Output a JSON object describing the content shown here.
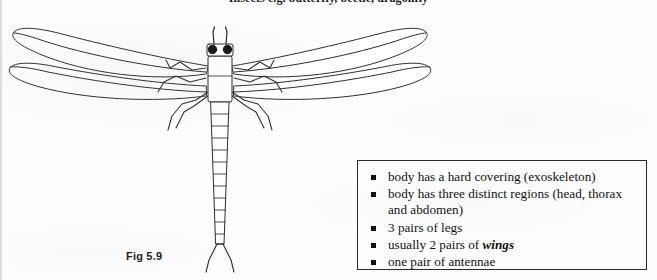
{
  "page": {
    "heading": "Insects e.g. butterfly, beetle, dragonfly",
    "figure_caption": "Fig 5.9"
  },
  "figure": {
    "subject": "dragonfly",
    "alt": "line drawing of a dragonfly seen from above",
    "parts": [
      "antennae",
      "compound eyes",
      "head",
      "thorax",
      "forewings",
      "hindwings",
      "legs",
      "segmented abdomen",
      "tail cerci"
    ],
    "abdomen_segments": 11,
    "wing_pairs": 2,
    "leg_pairs": 3,
    "antennae_pairs": 1,
    "line_color": "#2a2a2a",
    "fill_color": "#ffffff"
  },
  "facts_box": {
    "border_color": "#2b2b2b",
    "bullet_glyph": "square",
    "items": [
      {
        "text": "body has a hard covering (exoskeleton)"
      },
      {
        "text": "body has three distinct regions (head, thorax and abdomen)"
      },
      {
        "text": "3 pairs of legs"
      },
      {
        "text_before": "usually 2 pairs of ",
        "emphasis": "wings",
        "text_after": ""
      },
      {
        "text": "one pair of antennae"
      }
    ]
  }
}
